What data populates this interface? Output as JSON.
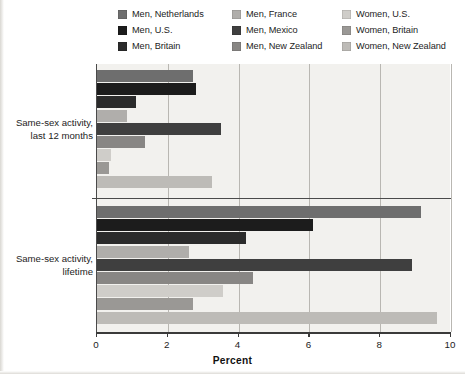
{
  "chart_data": {
    "type": "bar",
    "orientation": "horizontal",
    "title": "",
    "xlabel": "Percent",
    "ylabel": "",
    "xlim": [
      0,
      10
    ],
    "xticks": [
      0,
      2,
      4,
      6,
      8,
      10
    ],
    "xticklabels": [
      "0",
      "2",
      "4",
      "6",
      "8",
      "10"
    ],
    "grid": "vertical",
    "legend_position": "top",
    "categories": [
      "Same-sex activity, last 12 months",
      "Same-sex activity, lifetime"
    ],
    "category_lines": [
      [
        "Same-sex activity,",
        "last 12 months"
      ],
      [
        "Same-sex activity,",
        "lifetime"
      ]
    ],
    "series": [
      {
        "name": "Men, Netherlands",
        "color": "#6e6e6e",
        "values": [
          2.7,
          9.15
        ]
      },
      {
        "name": "Men, U.S.",
        "color": "#1c1c1c",
        "values": [
          2.8,
          6.1
        ]
      },
      {
        "name": "Men, Britain",
        "color": "#2b2b2b",
        "values": [
          1.1,
          4.2
        ]
      },
      {
        "name": "Men, France",
        "color": "#b0aeab",
        "values": [
          0.85,
          2.6
        ]
      },
      {
        "name": "Men, Mexico",
        "color": "#3f3f3f",
        "values": [
          3.5,
          8.9
        ]
      },
      {
        "name": "Men, New Zealand",
        "color": "#888684",
        "values": [
          1.35,
          4.4
        ]
      },
      {
        "name": "Women, U.S.",
        "color": "#cfcdc9",
        "values": [
          0.4,
          3.55
        ]
      },
      {
        "name": "Women, Britain",
        "color": "#9a9895",
        "values": [
          0.35,
          2.7
        ]
      },
      {
        "name": "Women, New Zealand",
        "color": "#bdbbb7",
        "values": [
          3.25,
          9.6
        ]
      }
    ]
  },
  "legend": {
    "items": [
      {
        "label": "Men, Netherlands",
        "color": "#6e6e6e"
      },
      {
        "label": "Men, France",
        "color": "#b0aeab"
      },
      {
        "label": "Women, U.S.",
        "color": "#cfcdc9"
      },
      {
        "label": "Men, U.S.",
        "color": "#1c1c1c"
      },
      {
        "label": "Men, Mexico",
        "color": "#3f3f3f"
      },
      {
        "label": "Women, Britain",
        "color": "#9a9895"
      },
      {
        "label": "Men, Britain",
        "color": "#2b2b2b"
      },
      {
        "label": "Men, New Zealand",
        "color": "#888684"
      },
      {
        "label": "Women, New Zealand",
        "color": "#bdbbb7"
      }
    ]
  },
  "axis": {
    "x_title": "Percent",
    "tick_labels": [
      "0",
      "2",
      "4",
      "6",
      "8",
      "10"
    ]
  }
}
